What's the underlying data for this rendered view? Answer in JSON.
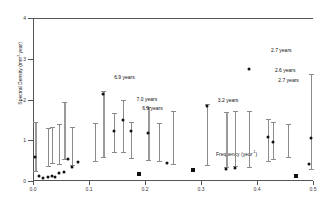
{
  "chart_data": {
    "type": "scatter",
    "title": "",
    "xlabel": "Frequency (year-1)",
    "xlabel_main": "Frequency (year",
    "xlabel_sup": "-1",
    "xlabel_tail": ")",
    "ylabel_main": "Spectral Density (mm",
    "ylabel_sup": "2",
    "ylabel_tail": " year)",
    "ylabel": "Spectral Density (mm2 year)",
    "xlim": [
      0.0,
      0.5
    ],
    "ylim": [
      0,
      4
    ],
    "xticks": [
      "0.0",
      "0.1",
      "0.2",
      "0.3",
      "0.4",
      "0.5"
    ],
    "xtick_values": [
      0.0,
      0.1,
      0.2,
      0.3,
      0.4,
      0.5
    ],
    "yticks": [
      "0",
      "1",
      "2",
      "3",
      "4"
    ],
    "ytick_values": [
      0,
      1,
      2,
      3,
      4
    ],
    "grid": false,
    "legend": false,
    "points": [
      {
        "x": 0.003,
        "y": 0.6,
        "style": "dot"
      },
      {
        "x": 0.011,
        "y": 0.13,
        "style": "dot"
      },
      {
        "x": 0.018,
        "y": 0.07,
        "style": "dot"
      },
      {
        "x": 0.026,
        "y": 0.09,
        "style": "dot"
      },
      {
        "x": 0.034,
        "y": 0.12,
        "style": "dot"
      },
      {
        "x": 0.04,
        "y": 0.09,
        "style": "dot"
      },
      {
        "x": 0.047,
        "y": 0.2,
        "style": "dot"
      },
      {
        "x": 0.056,
        "y": 0.22,
        "style": "dot"
      },
      {
        "x": 0.062,
        "y": 0.55,
        "style": "dot"
      },
      {
        "x": 0.07,
        "y": 0.34,
        "style": "dot"
      },
      {
        "x": 0.08,
        "y": 0.46,
        "style": "dot"
      },
      {
        "x": 0.125,
        "y": 2.13,
        "style": "dot"
      },
      {
        "x": 0.145,
        "y": 1.23,
        "style": "dot"
      },
      {
        "x": 0.16,
        "y": 1.5,
        "style": "dot"
      },
      {
        "x": 0.175,
        "y": 1.22,
        "style": "dot"
      },
      {
        "x": 0.19,
        "y": 0.16,
        "style": "square"
      },
      {
        "x": 0.205,
        "y": 1.18,
        "style": "dot"
      },
      {
        "x": 0.24,
        "y": 0.43,
        "style": "dot"
      },
      {
        "x": 0.285,
        "y": 0.26,
        "style": "square"
      },
      {
        "x": 0.31,
        "y": 1.85,
        "style": "dot"
      },
      {
        "x": 0.345,
        "y": 0.3,
        "style": "dot"
      },
      {
        "x": 0.36,
        "y": 0.31,
        "style": "dot"
      },
      {
        "x": 0.385,
        "y": 2.74,
        "style": "dot"
      },
      {
        "x": 0.42,
        "y": 1.08,
        "style": "dot"
      },
      {
        "x": 0.428,
        "y": 0.96,
        "style": "dot"
      },
      {
        "x": 0.47,
        "y": 0.12,
        "style": "square"
      },
      {
        "x": 0.492,
        "y": 0.42,
        "style": "dot"
      },
      {
        "x": 0.497,
        "y": 1.05,
        "style": "dot"
      }
    ],
    "error_bars": [
      {
        "x": 0.003,
        "low": 0.25,
        "high": 1.45,
        "wide": true
      },
      {
        "x": 0.026,
        "low": 0.38,
        "high": 1.3,
        "wide": false
      },
      {
        "x": 0.034,
        "low": 0.45,
        "high": 1.32,
        "wide": false
      },
      {
        "x": 0.047,
        "low": 0.42,
        "high": 1.4,
        "wide": false
      },
      {
        "x": 0.056,
        "low": 0.55,
        "high": 1.93,
        "wide": true
      },
      {
        "x": 0.07,
        "low": 0.4,
        "high": 1.32,
        "wide": false
      },
      {
        "x": 0.11,
        "low": 0.48,
        "high": 1.42,
        "wide": false
      },
      {
        "x": 0.125,
        "low": 0.6,
        "high": 2.2,
        "wide": true
      },
      {
        "x": 0.145,
        "low": 0.72,
        "high": 1.68,
        "wide": false
      },
      {
        "x": 0.16,
        "low": 0.7,
        "high": 2.0,
        "wide": false
      },
      {
        "x": 0.175,
        "low": 0.56,
        "high": 1.46,
        "wide": false
      },
      {
        "x": 0.205,
        "low": 0.52,
        "high": 1.82,
        "wide": true
      },
      {
        "x": 0.225,
        "low": 0.5,
        "high": 1.42,
        "wide": false
      },
      {
        "x": 0.25,
        "low": 0.42,
        "high": 1.72,
        "wide": false
      },
      {
        "x": 0.31,
        "low": 0.4,
        "high": 1.88,
        "wide": false
      },
      {
        "x": 0.345,
        "low": 0.34,
        "high": 1.7,
        "wide": true
      },
      {
        "x": 0.36,
        "low": 0.36,
        "high": 1.72,
        "wide": false
      },
      {
        "x": 0.385,
        "low": 0.35,
        "high": 1.72,
        "wide": false
      },
      {
        "x": 0.42,
        "low": 0.48,
        "high": 1.52,
        "wide": false
      },
      {
        "x": 0.428,
        "low": 0.55,
        "high": 1.45,
        "wide": false
      },
      {
        "x": 0.455,
        "low": 0.6,
        "high": 1.4,
        "wide": false
      },
      {
        "x": 0.497,
        "low": 0.3,
        "high": 2.62,
        "wide": false
      }
    ],
    "annotations": [
      {
        "text": "6.9 years",
        "x": 0.145,
        "y": 2.55
      },
      {
        "text": "7.0 years",
        "x": 0.185,
        "y": 2.02
      },
      {
        "text": "6.9 years",
        "x": 0.195,
        "y": 1.8
      },
      {
        "text": "3.2 years",
        "x": 0.33,
        "y": 1.98
      },
      {
        "text": "2.7 years",
        "x": 0.425,
        "y": 3.22
      },
      {
        "text": "2.6 years",
        "x": 0.432,
        "y": 2.72
      },
      {
        "text": "2.7 years",
        "x": 0.438,
        "y": 2.48
      }
    ]
  }
}
